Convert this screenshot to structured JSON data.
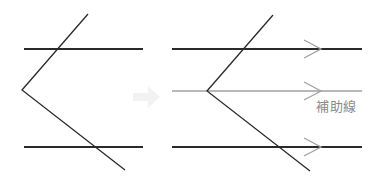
{
  "diagram": {
    "auxiliary_line_label": "補助線",
    "colors": {
      "line": "#2a2a2a",
      "auxiliary": "#a0a0a0",
      "arrow_hint": "#f0f0f0"
    }
  }
}
